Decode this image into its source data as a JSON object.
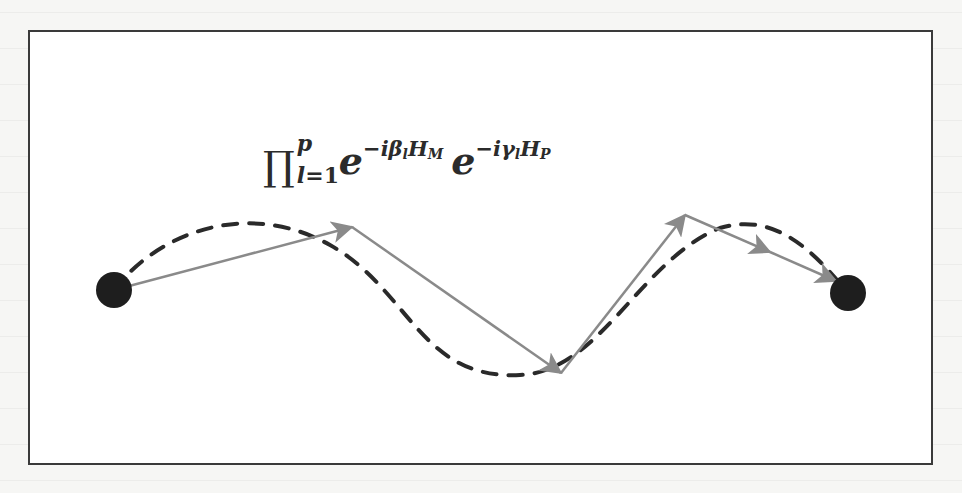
{
  "figure": {
    "formula": {
      "operator": "∏",
      "upper": "p",
      "lower_var": "l",
      "lower_eq": "=1",
      "term1": {
        "base": "e",
        "exponent": "−iβ",
        "exponent_sub": "l",
        "operator": "H",
        "operator_sub": "M"
      },
      "term2": {
        "base": "e",
        "exponent": "−iγ",
        "exponent_sub": "l",
        "operator": "H",
        "operator_sub": "P"
      }
    },
    "nodes": [
      {
        "id": "start",
        "x": 114,
        "y": 290,
        "r": 18,
        "color": "#1e1e1e"
      },
      {
        "id": "end",
        "x": 848,
        "y": 293,
        "r": 18,
        "color": "#1e1e1e"
      }
    ],
    "solid_path": {
      "color": "#8a8a8a",
      "points": [
        [
          114,
          290
        ],
        [
          352,
          227
        ],
        [
          561,
          373
        ],
        [
          685,
          215
        ],
        [
          836,
          281
        ]
      ]
    },
    "dashed_path": {
      "color": "#2a2a2a",
      "description": "smooth dashed curve from start to end node"
    },
    "colors": {
      "frame": "#3a3a3a",
      "background": "#ffffff"
    }
  }
}
